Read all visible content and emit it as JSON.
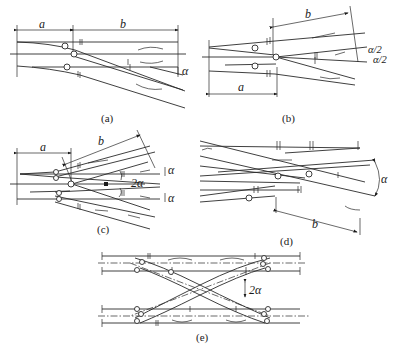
{
  "diagram": {
    "panels": [
      {
        "id": "a",
        "caption": "(a)",
        "labels": {
          "dim_a": "a",
          "dim_b": "b",
          "angle": "α"
        }
      },
      {
        "id": "b",
        "caption": "(b)",
        "labels": {
          "dim_a": "a",
          "dim_b": "b",
          "angle_upper": "α/2",
          "angle_lower": "α/2"
        }
      },
      {
        "id": "c",
        "caption": "(c)",
        "labels": {
          "dim_a": "a",
          "dim_b": "b",
          "angle_upper": "α",
          "angle_middle": "2α",
          "angle_lower": "α"
        }
      },
      {
        "id": "d",
        "caption": "(d)",
        "labels": {
          "dim_b": "b",
          "angle": "α"
        }
      },
      {
        "id": "e",
        "caption": "(e)",
        "labels": {
          "angle": "2α"
        }
      }
    ]
  }
}
